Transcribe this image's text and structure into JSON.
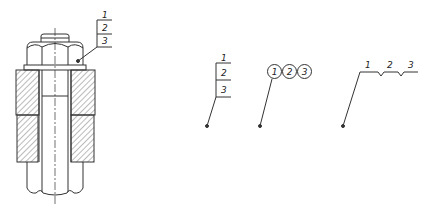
{
  "figure": {
    "colors": {
      "line": "#333333",
      "hatch": "#555555",
      "background": "#ffffff"
    }
  },
  "assembly_callout": {
    "labels": [
      "1",
      "2",
      "3"
    ]
  },
  "styles": {
    "stacked": {
      "labels": [
        "1",
        "2",
        "3"
      ]
    },
    "circled": {
      "labels": [
        "1",
        "2",
        "3"
      ]
    },
    "zigzag": {
      "labels": [
        "1",
        "2",
        "3"
      ]
    }
  }
}
